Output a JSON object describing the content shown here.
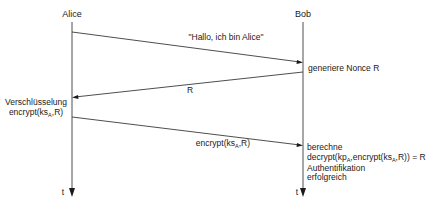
{
  "diagram": {
    "type": "sequence-diagram",
    "participants": [
      {
        "name": "Alice",
        "time_label": "t"
      },
      {
        "name": "Bob",
        "time_label": "t"
      }
    ],
    "messages": [
      {
        "from": "Alice",
        "to": "Bob",
        "label": "\"Hallo, ich bin Alice\""
      },
      {
        "from": "Bob",
        "to": "Alice",
        "label": "R"
      },
      {
        "from": "Alice",
        "to": "Bob",
        "label_main": "encrypt(ks",
        "label_sub": "A",
        "label_tail": ",R)"
      }
    ],
    "notes": {
      "bob_nonce": "generiere Nonce R",
      "alice_encrypt_line1": "Verschlüsselung",
      "alice_encrypt_line2_main": "encrypt(ks",
      "alice_encrypt_line2_sub": "A",
      "alice_encrypt_line2_tail": ",R)",
      "bob_compute_line1": "berechne",
      "bob_compute_line2_a": "decrypt(kp",
      "bob_compute_line2_sub1": "A",
      "bob_compute_line2_b": ",encrypt(ks",
      "bob_compute_line2_sub2": "A",
      "bob_compute_line2_c": ",R)) = R",
      "bob_auth_line1": "Authentifikation",
      "bob_auth_line2": "erfolgreich"
    }
  }
}
